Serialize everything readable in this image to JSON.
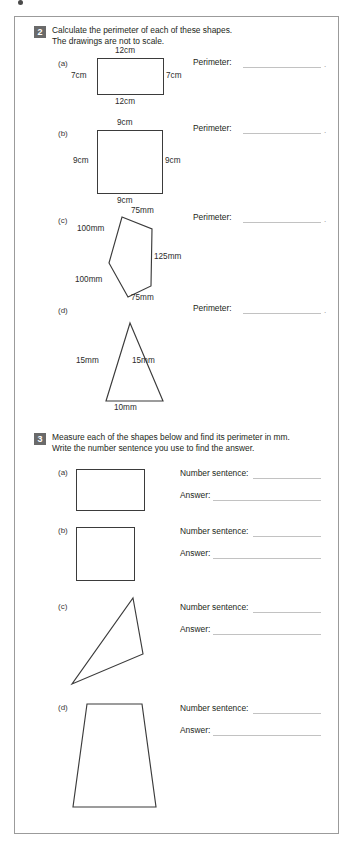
{
  "worksheet": {
    "page_border_color": "#9b9b9b",
    "ink_color": "#3b3b3b",
    "rule_color": "#c2c2c2",
    "badge_color": "#6a6a6a"
  },
  "questions": [
    {
      "number": "2",
      "prompt": "Calculate the perimeter of each of these shapes.\nThe drawings are not to scale.",
      "parts": [
        {
          "label": "(a)",
          "shape": "rectangle",
          "field_label": "Perimeter:",
          "dims": {
            "top": "12cm",
            "left": "7cm",
            "right": "7cm",
            "bottom": "12cm"
          }
        },
        {
          "label": "(b)",
          "shape": "square",
          "field_label": "Perimeter:",
          "dims": {
            "top": "9cm",
            "left": "9cm",
            "right": "9cm",
            "bottom": "9cm"
          }
        },
        {
          "label": "(c)",
          "shape": "pentagon",
          "field_label": "Perimeter:",
          "dims": {
            "top": "75mm",
            "upper_left": "100mm",
            "right": "125mm",
            "lower_left": "100mm",
            "bottom": "75mm"
          }
        },
        {
          "label": "(d)",
          "shape": "triangle",
          "field_label": "Perimeter:",
          "dims": {
            "left": "15mm",
            "right": "15mm",
            "bottom": "10mm"
          }
        }
      ]
    },
    {
      "number": "3",
      "prompt": "Measure each of the shapes below and find its perimeter in mm.\nWrite the number sentence you use to find the answer.",
      "parts": [
        {
          "label": "(a)",
          "shape": "rectangle",
          "field_label_1": "Number sentence:",
          "field_label_2": "Answer:"
        },
        {
          "label": "(b)",
          "shape": "square",
          "field_label_1": "Number sentence:",
          "field_label_2": "Answer:"
        },
        {
          "label": "(c)",
          "shape": "scalene-triangle",
          "field_label_1": "Number sentence:",
          "field_label_2": "Answer:"
        },
        {
          "label": "(d)",
          "shape": "trapezoid",
          "field_label_1": "Number sentence:",
          "field_label_2": "Answer:"
        }
      ]
    }
  ]
}
